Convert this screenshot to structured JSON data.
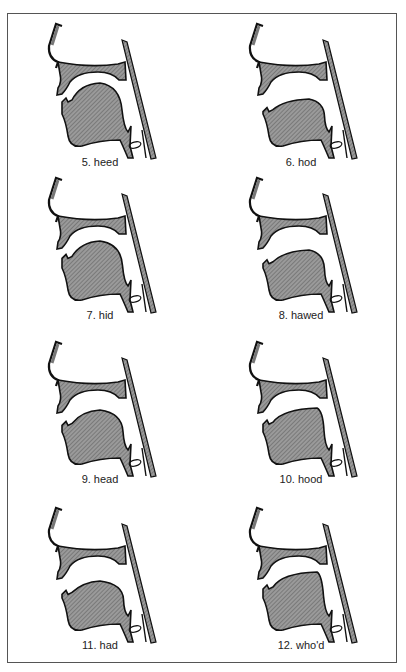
{
  "figure": {
    "colors": {
      "fill": "#8a8a8a",
      "stroke": "#111111",
      "frame": "#555555"
    },
    "panels": [
      {
        "number": "5",
        "word": "heed",
        "label": "5. heed",
        "tongue": "high-front"
      },
      {
        "number": "6",
        "word": "hod",
        "label": "6. hod",
        "tongue": "low-back"
      },
      {
        "number": "7",
        "word": "hid",
        "label": "7. hid",
        "tongue": "high-front-lax"
      },
      {
        "number": "8",
        "word": "hawed",
        "label": "8. hawed",
        "tongue": "low-back-rounded"
      },
      {
        "number": "9",
        "word": "head",
        "label": "9. head",
        "tongue": "mid-front"
      },
      {
        "number": "10",
        "word": "hood",
        "label": "10. hood",
        "tongue": "high-back-lax"
      },
      {
        "number": "11",
        "word": "had",
        "label": "11. had",
        "tongue": "low-front"
      },
      {
        "number": "12",
        "word": "who'd",
        "label": "12. who'd",
        "tongue": "high-back"
      }
    ]
  }
}
